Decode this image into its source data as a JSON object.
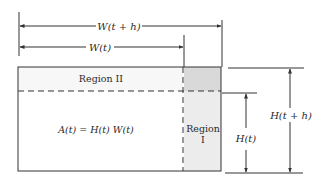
{
  "diagram": {
    "labels": {
      "width_next": "W(t + h)",
      "width_current": "W(t)",
      "region_two": "Region II",
      "region_one_line1": "Region",
      "region_one_line2": "I",
      "area_formula": "A(t) = H(t) W(t)",
      "height_current": "H(t)",
      "height_next": "H(t + h)"
    },
    "colors": {
      "line": "#333333",
      "region_one_fill": "#ececec",
      "region_one_top_fill": "#d9d9d9",
      "region_two_fill": "#f7f7f7",
      "background": "#ffffff"
    }
  }
}
